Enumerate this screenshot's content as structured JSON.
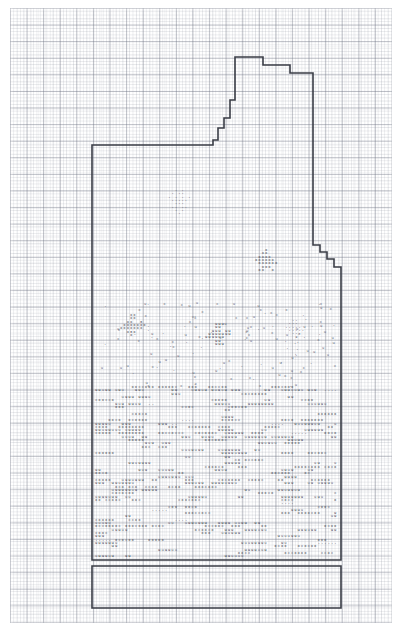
{
  "document": {
    "kind": "cross-stitch-pattern-chart",
    "title": "Cross Stitch Pattern Chart",
    "medium": "graph paper",
    "page_width": 403,
    "page_height": 632
  },
  "grid": {
    "small_cell_px": 3.32,
    "bold_cell_px": 16.6,
    "cells_per_block": 5,
    "minor_line_color": "#c8cbd4",
    "major_line_color": "#9aa0ad",
    "paper_color": "#ffffff",
    "left": 10,
    "top": 8,
    "width": 382,
    "height": 615
  },
  "outline": {
    "stroke_color": "#3a3d46",
    "stroke_width": 1.6,
    "description": "Heavy stepped boundary enclosing the stitched design, with a rectangular extension box at the bottom.",
    "main_path": "M 92,145 L 213,145 L 213,140 L 218,140 L 218,128 L 224,128 L 224,118 L 230,118 L 230,100 L 235,100 L 235,57 L 263,57 L 263,65 L 290,65 L 290,73 L 313,73 L 313,245 L 320,245 L 320,252 L 327,252 L 327,259 L 334,259 L 334,267 L 341,267 L 341,560 L 92,560 Z",
    "bottom_box_path": "M 92,566 L 341,566 L 341,608 L 92,608 Z"
  },
  "symbols": {
    "legend": [
      {
        "glyph": "x",
        "name": "cross-symbol",
        "color": "#2f3340"
      },
      {
        "glyph": "u",
        "name": "u-symbol",
        "color": "#2f3340"
      },
      {
        "glyph": ".",
        "name": "dot-symbol",
        "color": "#585d6b"
      }
    ],
    "cell_px": 3.32
  },
  "motifs": [
    {
      "name": "upper-flower-dot-motif",
      "glyph": ".",
      "origin": [
        168,
        188
      ],
      "rows": [
        "  . .  ",
        " . ..  ",
        ". . . .",
        " .....",
        "  ...  ",
        " .. .. ",
        "  . .  ",
        "   .   "
      ]
    },
    {
      "name": "right-cross-motif",
      "glyph": "x",
      "origin": [
        255,
        248
      ],
      "rows": [
        "   x   ",
        "  xx   ",
        " xxxx  ",
        "xxxxxx ",
        " xxxxxx",
        "  xxx  ",
        " xx  x "
      ]
    },
    {
      "name": "left-cross-motif",
      "glyph": "x",
      "origin": [
        120,
        313
      ],
      "rows": [
        "   xx   ",
        "   xx   ",
        "  xx  x ",
        " xxxxxxx",
        "xxxxxxx ",
        "  xxx   ",
        "   x    "
      ]
    },
    {
      "name": "center-u-motif",
      "glyph": "u",
      "origin": [
        205,
        322
      ],
      "rows": [
        "   uuu  ",
        "   uu   ",
        "  uuu uu",
        " uuuuuuu",
        "uuuuuu  ",
        "   uu   ",
        "   uuu  "
      ]
    },
    {
      "name": "right-dot-motif",
      "glyph": ".",
      "origin": [
        285,
        318
      ],
      "rows": [
        "  ..  ",
        " ...  ",
        "..... ",
        " .....",
        "  ... ",
        "   .  "
      ]
    }
  ],
  "bands": {
    "description": "Dense horizontal bands of repeating border stitching filling the lower two thirds of the charted area.",
    "top": 385,
    "bottom": 560,
    "left": 95,
    "right": 340
  }
}
